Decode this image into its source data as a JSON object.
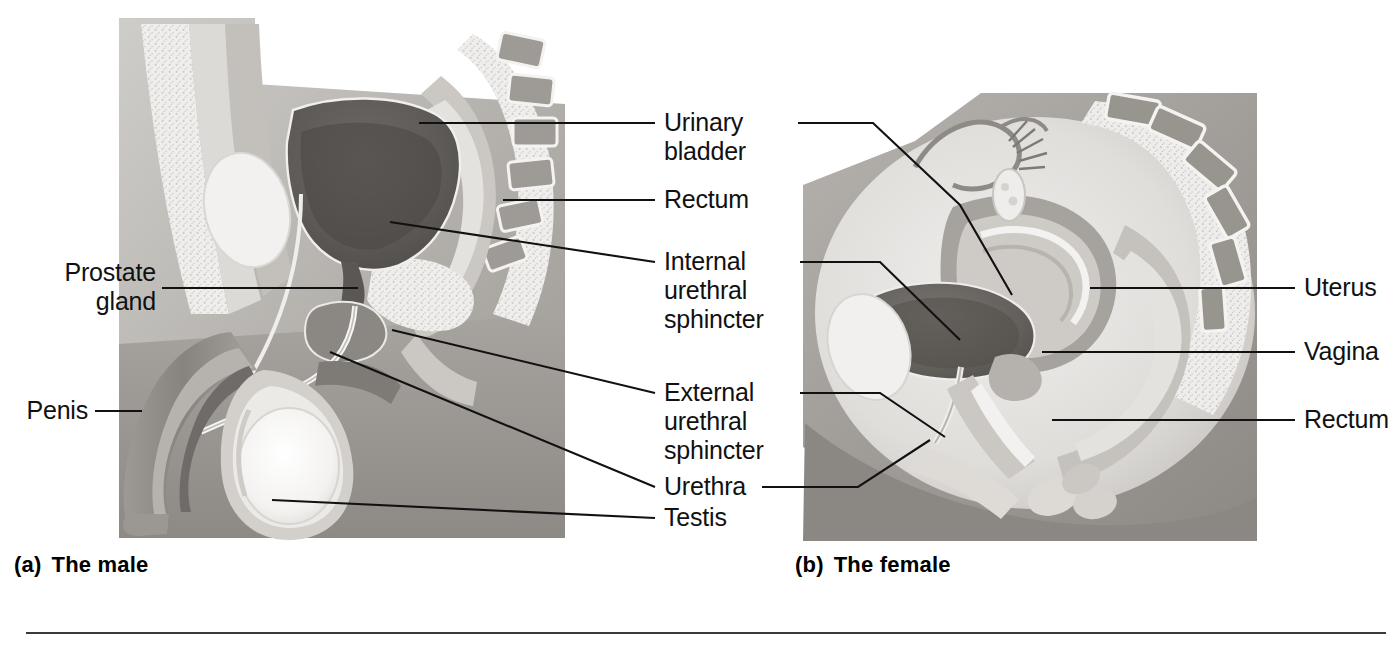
{
  "figure": {
    "panels": [
      {
        "id": "male",
        "caption_letter": "(a)",
        "caption_text": "The male"
      },
      {
        "id": "female",
        "caption_letter": "(b)",
        "caption_text": "The female"
      }
    ]
  },
  "labels": {
    "left": [
      {
        "name": "prostate-gland",
        "text": "Prostate\ngland"
      },
      {
        "name": "penis",
        "text": "Penis"
      }
    ],
    "center": [
      {
        "name": "urinary-bladder",
        "text": "Urinary\nbladder"
      },
      {
        "name": "rectum-male",
        "text": "Rectum"
      },
      {
        "name": "internal-urethral-sphincter",
        "text": "Internal\nurethral\nsphincter"
      },
      {
        "name": "external-urethral-sphincter",
        "text": "External\nurethral\nsphincter"
      },
      {
        "name": "urethra",
        "text": "Urethra"
      },
      {
        "name": "testis",
        "text": "Testis"
      }
    ],
    "right": [
      {
        "name": "uterus",
        "text": "Uterus"
      },
      {
        "name": "vagina",
        "text": "Vagina"
      },
      {
        "name": "rectum-female",
        "text": "Rectum"
      }
    ]
  },
  "colors": {
    "line": "#111111",
    "text": "#111111",
    "background": "#ffffff",
    "tissue_light": "#e8e6e2",
    "tissue_mid": "#b9b6b2",
    "tissue_dark": "#8f8c89",
    "organ_dark": "#6f6c69",
    "bone_speckle": "#efeeec",
    "rule": "#3a3a3a"
  }
}
